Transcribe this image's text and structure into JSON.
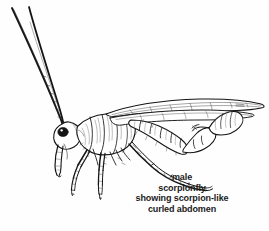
{
  "figure": {
    "domain": "natural-image-line-drawing",
    "subject_name": "male scorpionfly",
    "scientific_group": "Mecoptera",
    "view": "lateral",
    "style": "black ink line drawing with hatching",
    "background_color": "#fefefe",
    "ink_color": "#141414",
    "width_px": 269,
    "height_px": 231
  },
  "caption": {
    "lines": [
      "male",
      "scorpionfly",
      "showing scorpion-like",
      "curled abdomen"
    ],
    "line1": "male",
    "line2": "scorpionfly",
    "line3": "showing scorpion-like",
    "line4": "curled abdomen",
    "text_color": "#1a1a1a",
    "alignment": "center",
    "font_weight": "bold",
    "font_size_px": 9
  },
  "anatomy": {
    "parts": [
      {
        "name": "antenna-upper",
        "description": "long slender antenna curving up and to the left, tip near top-left corner"
      },
      {
        "name": "antenna-lower",
        "description": "second long slender antenna parallel to the first, slightly shorter"
      },
      {
        "name": "head",
        "description": "small head with large dark compound eye"
      },
      {
        "name": "compound-eye",
        "description": "solid black oval eye on the head"
      },
      {
        "name": "rostrum",
        "description": "elongated downward-pointing beak (rostrum) below the head"
      },
      {
        "name": "thorax",
        "description": "segmented thorax with fine hatching behind head"
      },
      {
        "name": "forewing",
        "description": "long narrow membranous forewing with veins extending to the right edge"
      },
      {
        "name": "hindwing",
        "description": "second narrow wing overlapping below the forewing"
      },
      {
        "name": "abdomen",
        "description": "segmented abdomen curving downward then upward, scorpion-like"
      },
      {
        "name": "genital-bulb",
        "description": "enlarged bulbous genital capsule at the abdomen tip, curled up and back"
      },
      {
        "name": "foreleg",
        "description": "slender spiny front leg angling down and left"
      },
      {
        "name": "midleg",
        "description": "slender spiny middle leg angling down"
      },
      {
        "name": "hindleg",
        "description": "very long spiny hind leg sweeping down and to the right"
      },
      {
        "name": "tarsus",
        "description": "segmented tarsi with claws at the leg tips"
      }
    ],
    "labels_visible": false
  }
}
